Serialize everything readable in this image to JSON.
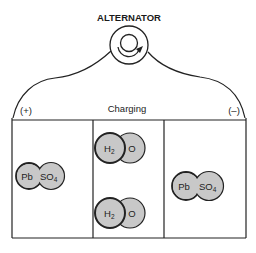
{
  "diagram": {
    "title": "ALTERNATOR",
    "state_label": "Charging",
    "positive_terminal": "(+)",
    "negative_terminal": "(–)",
    "colors": {
      "line": "#222222",
      "molecule_fill": "#c8c8c8",
      "background": "#ffffff"
    },
    "cells": [
      {
        "name": "positive-plate",
        "molecules": [
          {
            "part1": "Pb",
            "part2_main": "SO",
            "part2_sub": "4"
          }
        ]
      },
      {
        "name": "electrolyte",
        "molecules": [
          {
            "part1_main": "H",
            "part1_sub": "2",
            "part2": "O"
          },
          {
            "part1_main": "H",
            "part1_sub": "2",
            "part2": "O"
          }
        ]
      },
      {
        "name": "negative-plate",
        "molecules": [
          {
            "part1": "Pb",
            "part2_main": "SO",
            "part2_sub": "4"
          }
        ]
      }
    ]
  }
}
